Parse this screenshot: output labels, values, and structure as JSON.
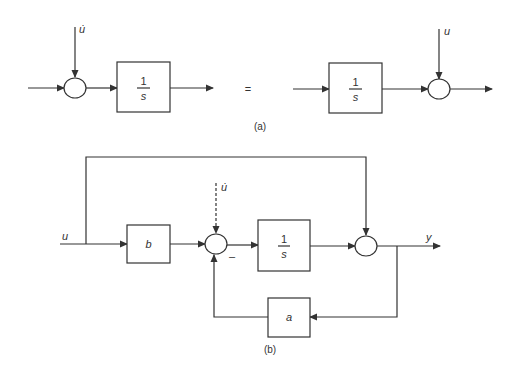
{
  "diagram": {
    "part_a": {
      "caption": "(a)",
      "equals_sign": "=",
      "left": {
        "disturbance_label": "u̇",
        "block": {
          "numerator": "1",
          "denominator": "s"
        }
      },
      "right": {
        "disturbance_label": "u",
        "block": {
          "numerator": "1",
          "denominator": "s"
        }
      }
    },
    "part_b": {
      "caption": "(b)",
      "input_label": "u",
      "output_label": "y",
      "gain_b_label": "b",
      "gain_a_label": "a",
      "dashed_input_label": "u̇",
      "minus_sign": "–",
      "integrator": {
        "numerator": "1",
        "denominator": "s"
      }
    },
    "colors": {
      "stroke": "#333333",
      "background": "#ffffff"
    }
  }
}
